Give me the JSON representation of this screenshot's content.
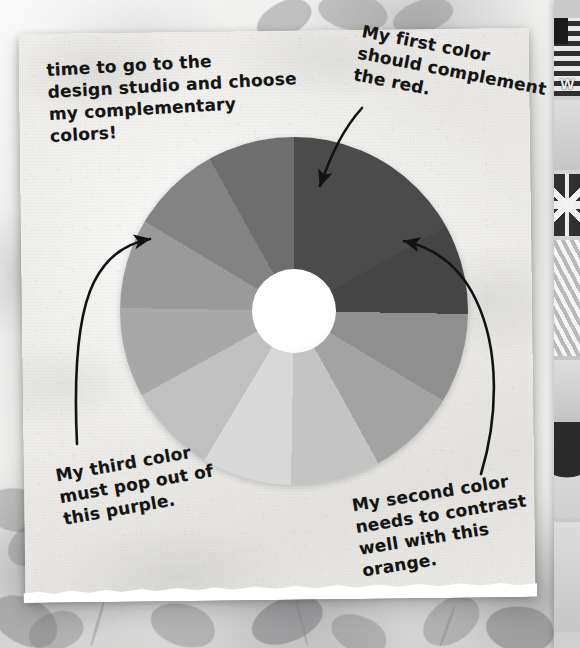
{
  "scene": {
    "width": 580,
    "height": 648,
    "description": "Photograph of a torn sheet of textured paper on a floral fabric background, showing a printed twelve-segment color wheel with four handwritten annotations and hand-drawn curved arrows pointing at wheel segments."
  },
  "notes": {
    "top_left": {
      "id": "note-top-left",
      "text": "time to go to the\ndesign studio and choose\nmy complementary\ncolors!",
      "has_arrow": false
    },
    "top_right": {
      "id": "note-top-right",
      "text": "My first color\nshould complement\nthe red.",
      "has_arrow": true,
      "arrow_target": "red-segment"
    },
    "bottom_left": {
      "id": "note-bottom-left",
      "text": "My third color\nmust pop out of\nthis purple.",
      "has_arrow": true,
      "arrow_target": "purple-segment"
    },
    "bottom_right": {
      "id": "note-bottom-right",
      "text": "My second color\nneeds to contrast\nwell with this\norange.",
      "has_arrow": true,
      "arrow_target": "orange-segment"
    }
  },
  "color_wheel": {
    "name": "color-wheel",
    "center_x": 294,
    "center_y": 311,
    "outer_radius": 174,
    "hub_radius": 42,
    "hub_color": "#ffffff",
    "segment_count": 12,
    "segments": [
      {
        "index": 0,
        "label": "red",
        "start_deg": 301,
        "end_deg": 331,
        "color": "#4b4b4b"
      },
      {
        "index": 1,
        "label": "red-orange",
        "start_deg": 331,
        "end_deg": 1,
        "color": "#454545"
      },
      {
        "index": 2,
        "label": "orange",
        "start_deg": 1,
        "end_deg": 31,
        "color": "#8f8f8f"
      },
      {
        "index": 3,
        "label": "yellow-orange",
        "start_deg": 31,
        "end_deg": 61,
        "color": "#a3a3a3"
      },
      {
        "index": 4,
        "label": "yellow",
        "start_deg": 61,
        "end_deg": 91,
        "color": "#c4c4c4"
      },
      {
        "index": 5,
        "label": "yellow-green",
        "start_deg": 91,
        "end_deg": 121,
        "color": "#d8d8d8"
      },
      {
        "index": 6,
        "label": "green",
        "start_deg": 121,
        "end_deg": 151,
        "color": "#c0c0c0"
      },
      {
        "index": 7,
        "label": "blue-green",
        "start_deg": 151,
        "end_deg": 181,
        "color": "#a8a8a8"
      },
      {
        "index": 8,
        "label": "blue",
        "start_deg": 181,
        "end_deg": 211,
        "color": "#9a9a9a"
      },
      {
        "index": 9,
        "label": "blue-violet",
        "start_deg": 211,
        "end_deg": 241,
        "color": "#838383"
      },
      {
        "index": 10,
        "label": "violet",
        "start_deg": 241,
        "end_deg": 271,
        "color": "#6e6e6e"
      },
      {
        "index": 11,
        "label": "purple",
        "start_deg": 271,
        "end_deg": 301,
        "color": "#4f4f4f"
      }
    ]
  },
  "arrows": [
    {
      "name": "arrow-to-red",
      "from": "note-top-right",
      "to": "red-segment",
      "direction": "down-left"
    },
    {
      "name": "arrow-to-purple",
      "from": "note-bottom-left",
      "to": "purple-segment",
      "direction": "up-right"
    },
    {
      "name": "arrow-to-orange",
      "from": "note-bottom-right",
      "to": "orange-segment",
      "direction": "up-left"
    }
  ],
  "photo_strip": {
    "name": "photo-strip",
    "cells": [
      {
        "index": 0,
        "kind": "us-flag-poster",
        "caption": "W"
      },
      {
        "index": 1,
        "kind": "blank-gray",
        "caption": ""
      },
      {
        "index": 2,
        "kind": "uk-flag",
        "caption": ""
      },
      {
        "index": 3,
        "kind": "diagonal-stripes",
        "caption": ""
      },
      {
        "index": 4,
        "kind": "dark-arch",
        "caption": ""
      },
      {
        "index": 5,
        "kind": "blank-gray",
        "caption": ""
      }
    ]
  },
  "palette": {
    "paper": "#ecebe7",
    "ink": "#151515",
    "background": "#e9e9e7",
    "hub": "#ffffff",
    "darkest_segment": "#454545",
    "lightest_segment": "#d8d8d8"
  }
}
